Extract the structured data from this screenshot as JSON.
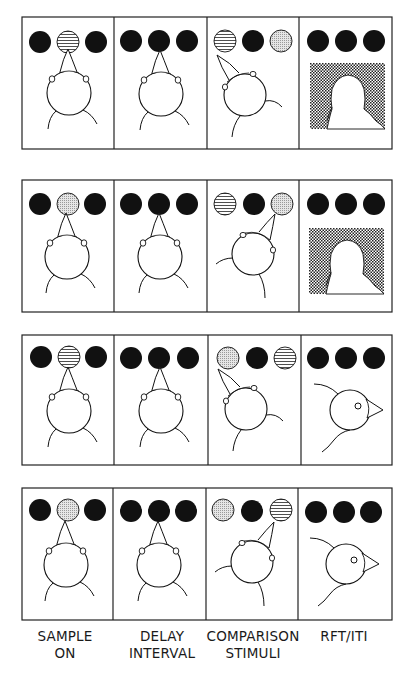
{
  "figure": {
    "type": "delayed matching-to-sample trial sequence",
    "columns": [
      {
        "label_line1": "SAMPLE",
        "label_line2": "ON"
      },
      {
        "label_line1": "DELAY",
        "label_line2": "INTERVAL"
      },
      {
        "label_line1": "COMPARISON",
        "label_line2": "STIMULI"
      },
      {
        "label_line1": "RFT/ITI",
        "label_line2": ""
      }
    ],
    "stimulus_key": {
      "dark": "unlit/dark key",
      "lines": "horizontal-lines stimulus",
      "dots": "dotted/stippled stimulus"
    },
    "colors": {
      "ink": "#111111",
      "dots": "#c8c8c8",
      "paper": "#ffffff"
    },
    "rows": [
      {
        "panels": [
          {
            "keys": [
              "dark",
              "lines",
              "dark"
            ],
            "bird": "front"
          },
          {
            "keys": [
              "dark",
              "dark",
              "dark"
            ],
            "bird": "front"
          },
          {
            "keys": [
              "lines",
              "dark",
              "dots"
            ],
            "bird": "peck-left"
          },
          {
            "keys": [
              "dark",
              "dark",
              "dark"
            ],
            "bird": "hopper"
          }
        ]
      },
      {
        "panels": [
          {
            "keys": [
              "dark",
              "dots",
              "dark"
            ],
            "bird": "front"
          },
          {
            "keys": [
              "dark",
              "dark",
              "dark"
            ],
            "bird": "front"
          },
          {
            "keys": [
              "lines",
              "dark",
              "dots"
            ],
            "bird": "peck-right"
          },
          {
            "keys": [
              "dark",
              "dark",
              "dark"
            ],
            "bird": "hopper"
          }
        ]
      },
      {
        "panels": [
          {
            "keys": [
              "dark",
              "lines",
              "dark"
            ],
            "bird": "front"
          },
          {
            "keys": [
              "dark",
              "dark",
              "dark"
            ],
            "bird": "front"
          },
          {
            "keys": [
              "dots",
              "dark",
              "lines"
            ],
            "bird": "peck-left"
          },
          {
            "keys": [
              "dark",
              "dark",
              "dark"
            ],
            "bird": "side"
          }
        ]
      },
      {
        "panels": [
          {
            "keys": [
              "dark",
              "dots",
              "dark"
            ],
            "bird": "front"
          },
          {
            "keys": [
              "dark",
              "dark",
              "dark"
            ],
            "bird": "front"
          },
          {
            "keys": [
              "dots",
              "dark",
              "lines"
            ],
            "bird": "peck-right"
          },
          {
            "keys": [
              "dark",
              "dark",
              "dark"
            ],
            "bird": "side"
          }
        ]
      }
    ]
  }
}
